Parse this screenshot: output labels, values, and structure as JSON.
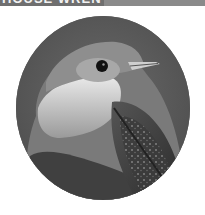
{
  "banner": {
    "title": "HOUSE WREN"
  },
  "photo": {
    "subject": "House wren (bird) portrait",
    "style": "grayscale",
    "shape": "circle",
    "colors": {
      "background": "#5a5a5a",
      "banner": "#8a8a8a",
      "banner_dark": "#6f6f6f"
    }
  }
}
